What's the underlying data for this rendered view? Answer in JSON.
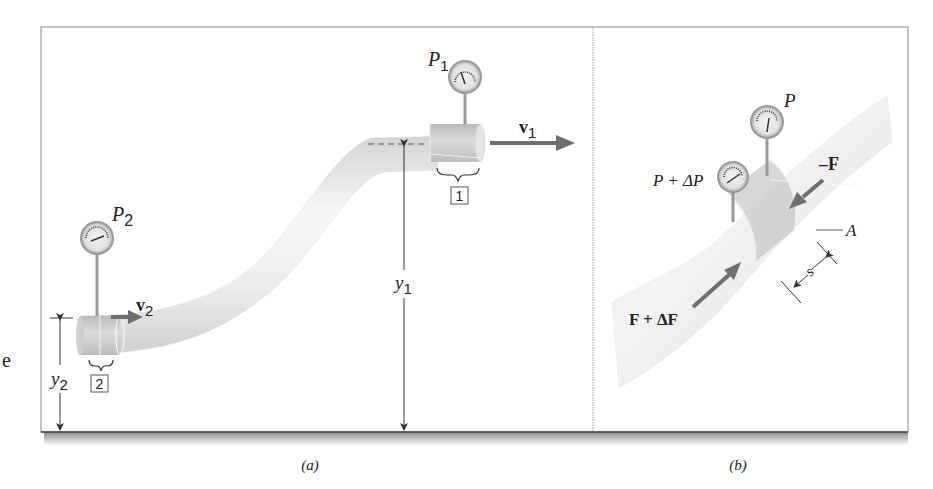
{
  "figure": {
    "stray_char": "e",
    "panel_a": {
      "caption": "(a)",
      "gauge_1_label": "P",
      "gauge_1_sub": "1",
      "gauge_2_label": "P",
      "gauge_2_sub": "2",
      "velocity_1_label": "v",
      "velocity_1_sub": "1",
      "velocity_2_label": "v",
      "velocity_2_sub": "2",
      "height_1_label": "y",
      "height_1_sub": "1",
      "height_2_label": "y",
      "height_2_sub": "2",
      "section_1_box": "1",
      "section_2_box": "2"
    },
    "panel_b": {
      "caption": "(b)",
      "gauge_upper_label": "P",
      "gauge_lower_label": "P + ΔP",
      "force_neg_label": "–F",
      "force_pos_label": "F + ΔF",
      "area_label": "A",
      "length_label": "s"
    },
    "colors": {
      "frame": "#8a8a8a",
      "pipe_light": "#f4f4f4",
      "pipe_mid": "#d9d9d9",
      "pipe_dark": "#bdbdbd",
      "arrow": "#6e6e6e",
      "shadow": "#9a9a9a"
    }
  }
}
